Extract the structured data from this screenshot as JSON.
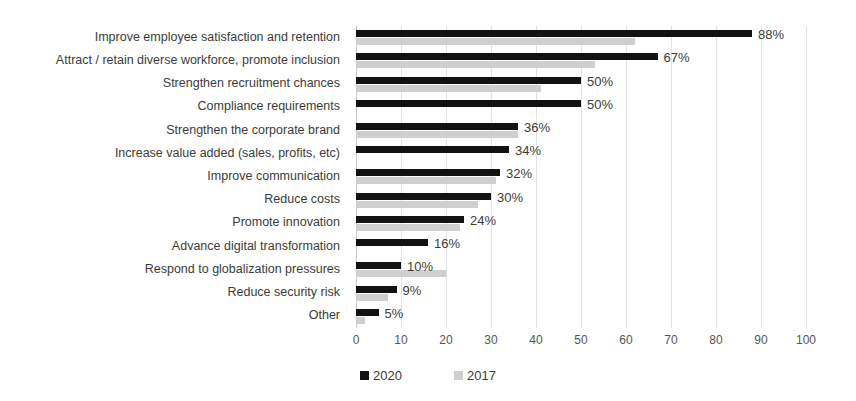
{
  "chart_data": {
    "type": "bar",
    "orientation": "horizontal",
    "title": "",
    "subtitle": "",
    "xlabel": "",
    "ylabel": "",
    "xlim": [
      0,
      100
    ],
    "xticks": [
      "0",
      "10",
      "20",
      "30",
      "40",
      "50",
      "60",
      "70",
      "80",
      "90",
      "100"
    ],
    "grid": true,
    "legend_position": "bottom",
    "value_label_suffix": "%",
    "categories": [
      "Improve employee satisfaction and retention",
      "Attract / retain diverse workforce, promote inclusion",
      "Strengthen recruitment chances",
      "Compliance requirements",
      "Strengthen the corporate brand",
      "Increase value added (sales, profits, etc)",
      "Improve communication",
      "Reduce costs",
      "Promote innovation",
      "Advance digital transformation",
      "Respond to globalization pressures",
      "Reduce security risk",
      "Other"
    ],
    "series": [
      {
        "name": "2020",
        "color": "#121212",
        "values": [
          88,
          67,
          50,
          50,
          36,
          34,
          32,
          30,
          24,
          16,
          10,
          9,
          5
        ],
        "labels": [
          "88%",
          "67%",
          "50%",
          "50%",
          "36%",
          "34%",
          "32%",
          "30%",
          "24%",
          "16%",
          "10%",
          "9%",
          "5%"
        ]
      },
      {
        "name": "2017",
        "color": "#cfcfcf",
        "values": [
          62,
          53,
          41,
          0,
          36,
          0,
          31,
          27,
          23,
          0,
          20,
          7,
          2
        ],
        "labels": [
          "",
          "",
          "",
          "",
          "",
          "",
          "",
          "",
          "",
          "",
          "",
          "",
          ""
        ]
      }
    ]
  },
  "legend": {
    "items": [
      {
        "label": "2020",
        "color": "#121212"
      },
      {
        "label": "2017",
        "color": "#cfcfcf"
      }
    ]
  }
}
